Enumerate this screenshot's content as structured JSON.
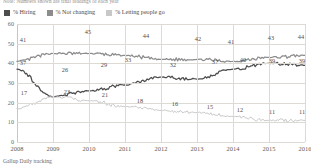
{
  "note": {
    "text": "Note: Numbers shown are final readings of each year"
  },
  "legend": {
    "items": [
      {
        "label": "% Hiring",
        "color": "#4d4d4d"
      },
      {
        "label": "% Not changing",
        "color": "#8c8c8c"
      },
      {
        "label": "% Letting people go",
        "color": "#c8c8c8"
      }
    ]
  },
  "source": {
    "text": "Gallup Daily tracking"
  },
  "chart_data": {
    "type": "line",
    "title": "",
    "subtitle": "",
    "xlabel": "",
    "ylabel": "",
    "ylim": [
      0,
      60
    ],
    "yticks": [
      0,
      10,
      20,
      30,
      40,
      50,
      60
    ],
    "grid": true,
    "legend_position": "top-left",
    "x": [
      "2008",
      "2009",
      "2010",
      "2011",
      "2012",
      "2013",
      "2014",
      "2015",
      "2016"
    ],
    "categories": [
      "2008",
      "2009",
      "2010",
      "2011",
      "2012",
      "2013",
      "2014",
      "2015",
      "2016"
    ],
    "series": [
      {
        "name": "% Not changing",
        "color": "#8c8c8c",
        "values": [
          41,
          45,
          45,
          44,
          42,
          42,
          41,
          43,
          44
        ],
        "labels": [
          {
            "x": "2008",
            "value": 41
          },
          {
            "x": "2010",
            "value": 45
          },
          {
            "x": "2011",
            "value": 44
          },
          {
            "x": "2013",
            "value": 42
          },
          {
            "x": "2014",
            "value": 41
          },
          {
            "x": "2015",
            "value": 43
          },
          {
            "x": "2016",
            "value": 44
          }
        ]
      },
      {
        "name": "% Hiring",
        "color": "#4d4d4d",
        "values": [
          37,
          23,
          26,
          29,
          33,
          32,
          37,
          40,
          39
        ],
        "labels": [
          {
            "x": "2008",
            "value": 37
          },
          {
            "x": "2009",
            "value": 23
          },
          {
            "x": "2009",
            "value": 26
          },
          {
            "x": "2010",
            "value": 29
          },
          {
            "x": "2011",
            "value": 33
          },
          {
            "x": "2012",
            "value": 32
          },
          {
            "x": "2014",
            "value": 37
          },
          {
            "x": "2015",
            "value": 40
          },
          {
            "x": "2015",
            "value": 39
          },
          {
            "x": "2016",
            "value": 39
          }
        ]
      },
      {
        "name": "% Letting people go",
        "color": "#c8c8c8",
        "values": [
          17,
          23,
          21,
          18,
          16,
          15,
          13,
          11,
          11
        ],
        "labels": [
          {
            "x": "2008",
            "value": 17
          },
          {
            "x": "2009",
            "value": 23
          },
          {
            "x": "2010",
            "value": 21
          },
          {
            "x": "2011",
            "value": 18
          },
          {
            "x": "2012",
            "value": 16
          },
          {
            "x": "2013",
            "value": 15
          },
          {
            "x": "2014",
            "value": 13
          },
          {
            "x": "2015",
            "value": 11
          },
          {
            "x": "2016",
            "value": 11
          }
        ]
      }
    ],
    "point_labels": [
      {
        "text": "41",
        "left": 23,
        "top": 40,
        "series": "% Not changing"
      },
      {
        "text": "45",
        "left": 88,
        "top": 32,
        "series": "% Not changing"
      },
      {
        "text": "44",
        "left": 146,
        "top": 36,
        "series": "% Not changing"
      },
      {
        "text": "42",
        "left": 198,
        "top": 39,
        "series": "% Not changing"
      },
      {
        "text": "41",
        "left": 231,
        "top": 42,
        "series": "% Not changing"
      },
      {
        "text": "43",
        "left": 271,
        "top": 38,
        "series": "% Not changing"
      },
      {
        "text": "44",
        "left": 301,
        "top": 37,
        "series": "% Not changing"
      },
      {
        "text": "37",
        "left": 23,
        "top": 63,
        "series": "% Hiring"
      },
      {
        "text": "26",
        "left": 65,
        "top": 70,
        "series": "% Hiring"
      },
      {
        "text": "29",
        "left": 104,
        "top": 65,
        "series": "% Hiring"
      },
      {
        "text": "33",
        "left": 128,
        "top": 60,
        "series": "% Hiring"
      },
      {
        "text": "32",
        "left": 173,
        "top": 65,
        "series": "% Hiring"
      },
      {
        "text": "37",
        "left": 215,
        "top": 62,
        "series": "% Hiring"
      },
      {
        "text": "40",
        "left": 243,
        "top": 60,
        "series": "% Hiring"
      },
      {
        "text": "39",
        "left": 272,
        "top": 61,
        "series": "% Hiring"
      },
      {
        "text": "39",
        "left": 302,
        "top": 61,
        "series": "% Hiring"
      },
      {
        "text": "17",
        "left": 24,
        "top": 93,
        "series": "% Letting people go"
      },
      {
        "text": "23",
        "left": 67,
        "top": 92,
        "series": "% Letting people go"
      },
      {
        "text": "21",
        "left": 105,
        "top": 95,
        "series": "% Letting people go"
      },
      {
        "text": "18",
        "left": 140,
        "top": 101,
        "series": "% Letting people go"
      },
      {
        "text": "16",
        "left": 175,
        "top": 104,
        "series": "% Letting people go"
      },
      {
        "text": "15",
        "left": 210,
        "top": 107,
        "series": "% Letting people go"
      },
      {
        "text": "12",
        "left": 240,
        "top": 110,
        "series": "% Letting people go"
      },
      {
        "text": "11",
        "left": 272,
        "top": 112,
        "series": "% Letting people go"
      },
      {
        "text": "11",
        "left": 302,
        "top": 112,
        "series": "% Letting people go"
      }
    ]
  }
}
